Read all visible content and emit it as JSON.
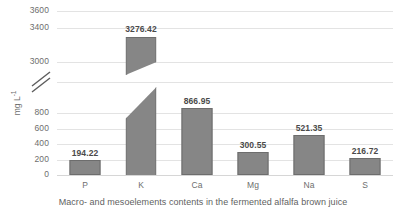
{
  "chart_data": {
    "type": "bar",
    "title": "",
    "xlabel": "Macro- and mesoelements contents in the fermented alfalfa brown juice",
    "ylabel": "mg L",
    "ylabel_exponent": "-1",
    "categories": [
      "P",
      "K",
      "Ca",
      "Mg",
      "Na",
      "S"
    ],
    "values": [
      194.22,
      3276.42,
      866.95,
      300.55,
      521.35,
      216.72
    ],
    "value_labels": [
      "194.22",
      "3276.42",
      "866.95",
      "300.55",
      "521.35",
      "216.72"
    ],
    "y_ticks_lower": [
      "0",
      "200",
      "400",
      "600",
      "800"
    ],
    "y_ticks_upper": [
      "3000",
      "3400",
      "3600"
    ],
    "axis_break": true,
    "axis_break_symbol": "double-slash",
    "broken_bar_category": "K",
    "ylim_lower": [
      0,
      800
    ],
    "ylim_upper": [
      3000,
      3600
    ],
    "grid": true,
    "legend": "none",
    "bar_color": "#868686",
    "bar_border_color": "#6d6d6d",
    "gridline_color": "#e3e3e3",
    "background_color": "#ffffff"
  }
}
